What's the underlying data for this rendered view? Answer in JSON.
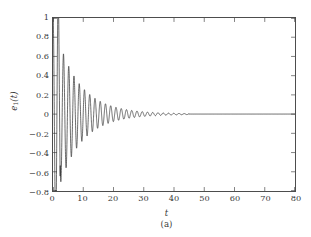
{
  "figure": {
    "caption": "(a)",
    "background_color": "#ffffff",
    "frame_color": "#4d4d4d",
    "line_color": "#2b2b2b"
  },
  "chart_data": {
    "type": "line",
    "title": "",
    "subtitle": "",
    "xlabel": "t",
    "ylabel": "e₁(t)",
    "ylabel_base": "e",
    "ylabel_sub": "1",
    "ylabel_arg": "(t)",
    "xlim": [
      0,
      80
    ],
    "ylim": [
      -0.8,
      1.0
    ],
    "xticks": [
      0,
      10,
      20,
      30,
      40,
      50,
      60,
      70,
      80
    ],
    "xticklabels": [
      "0",
      "10",
      "20",
      "30",
      "40",
      "50",
      "60",
      "70",
      "80"
    ],
    "yticks": [
      1,
      0.8,
      0.6,
      0.4,
      0.2,
      0,
      -0.2,
      -0.4,
      -0.6,
      -0.8
    ],
    "yticklabels": [
      "1",
      "0.8",
      "0.6",
      "0.4",
      "0.2",
      "0",
      "−0.2",
      "−0.4",
      "−0.6",
      "−0.8"
    ],
    "grid": false,
    "legend": false,
    "legend_position": "none",
    "annotations": [],
    "series": [
      {
        "name": "e1(t)",
        "color": "#2b2b2b",
        "linewidth": 0.7,
        "description": "Damped oscillatory synchronization error starting at 1.0, first undershoot to about -0.70 near t=1.6, decaying to zero by t=45",
        "model": {
          "form": "A*exp(-d*t)*cos(w*t + phi)",
          "amplitude": 1.0,
          "decay_rate": 0.115,
          "angular_frequency": 3.62,
          "phase": 0.0,
          "secondary_decay": 0.055,
          "settling_time": 45
        },
        "key_points": [
          {
            "t": 0.0,
            "y": 1.0
          },
          {
            "t": 0.85,
            "y": 0.0
          },
          {
            "t": 1.62,
            "y": -0.7
          },
          {
            "t": 2.5,
            "y": 0.0
          },
          {
            "t": 3.1,
            "y": 0.21
          },
          {
            "t": 4.0,
            "y": -0.3
          },
          {
            "t": 4.9,
            "y": 0.2
          },
          {
            "t": 5.8,
            "y": -0.27
          },
          {
            "t": 6.6,
            "y": 0.16
          },
          {
            "t": 7.5,
            "y": -0.22
          },
          {
            "t": 8.4,
            "y": 0.14
          },
          {
            "t": 9.3,
            "y": -0.18
          },
          {
            "t": 10.2,
            "y": 0.12
          },
          {
            "t": 11.1,
            "y": -0.15
          },
          {
            "t": 12.0,
            "y": 0.1
          },
          {
            "t": 13.8,
            "y": 0.09
          },
          {
            "t": 15.5,
            "y": 0.075
          },
          {
            "t": 17.3,
            "y": 0.065
          },
          {
            "t": 19.0,
            "y": 0.055
          },
          {
            "t": 21.0,
            "y": 0.045
          },
          {
            "t": 24.0,
            "y": 0.035
          },
          {
            "t": 27.0,
            "y": 0.026
          },
          {
            "t": 30.0,
            "y": 0.019
          },
          {
            "t": 34.0,
            "y": 0.012
          },
          {
            "t": 38.0,
            "y": 0.007
          },
          {
            "t": 42.0,
            "y": 0.004
          },
          {
            "t": 46.0,
            "y": 0.002
          },
          {
            "t": 55.0,
            "y": 0.0
          },
          {
            "t": 65.0,
            "y": 0.0
          },
          {
            "t": 80.0,
            "y": 0.0
          }
        ]
      }
    ]
  }
}
